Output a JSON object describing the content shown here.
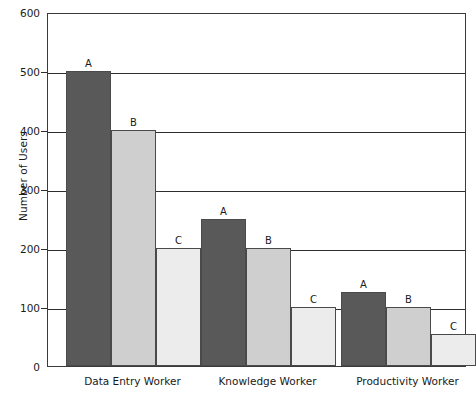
{
  "chart_data": {
    "type": "bar",
    "title": "",
    "subtitle": "",
    "xlabel": "",
    "ylabel": "Number of Users",
    "ylim": [
      0,
      600
    ],
    "yticks": [
      0,
      100,
      200,
      300,
      400,
      500,
      600
    ],
    "ytick_labels": [
      "0",
      "100",
      "200",
      "300",
      "400",
      "500",
      "600"
    ],
    "grid": "horizontal",
    "legend": "none",
    "categories": [
      "Data Entry Worker",
      "Knowledge Worker",
      "Productivity Worker"
    ],
    "series": [
      {
        "name": "A",
        "values": [
          500,
          250,
          125
        ],
        "color": "#595959"
      },
      {
        "name": "B",
        "values": [
          400,
          200,
          100
        ],
        "color": "#cfcfcf"
      },
      {
        "name": "C",
        "values": [
          200,
          100,
          55
        ],
        "color": "#ececec"
      }
    ],
    "bar_annotations": [
      {
        "label": "A",
        "category": "Data Entry Worker",
        "value": 500
      },
      {
        "label": "B",
        "category": "Data Entry Worker",
        "value": 400
      },
      {
        "label": "C",
        "category": "Data Entry Worker",
        "value": 200
      },
      {
        "label": "A",
        "category": "Knowledge Worker",
        "value": 250
      },
      {
        "label": "B",
        "category": "Knowledge Worker",
        "value": 200
      },
      {
        "label": "C",
        "category": "Knowledge Worker",
        "value": 100
      },
      {
        "label": "A",
        "category": "Productivity Worker",
        "value": 125
      },
      {
        "label": "B",
        "category": "Productivity Worker",
        "value": 100
      },
      {
        "label": "C",
        "category": "Productivity Worker",
        "value": 55
      }
    ]
  },
  "colors": {
    "series_a": "#595959",
    "series_b": "#cfcfcf",
    "series_c": "#ececec",
    "axis": "#2e2e2e",
    "text": "#1a1a1a",
    "background": "#ffffff"
  }
}
